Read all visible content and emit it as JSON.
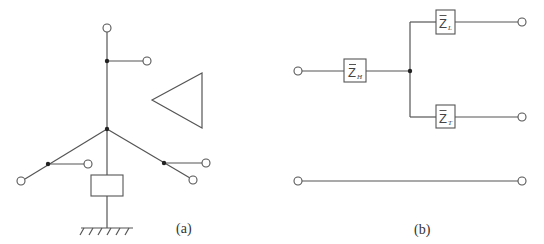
{
  "panel_a": {
    "label": "(a)",
    "description": "Branched mechanical/electrical tree with a box element and ground",
    "triangle_symbol": "triangle-pointing-left"
  },
  "panel_b": {
    "label": "(b)",
    "impedances": {
      "z_h": {
        "main": "Z",
        "sub": "H"
      },
      "z_l": {
        "main": "Z",
        "sub": "L"
      },
      "z_t": {
        "main": "Z",
        "sub": "T"
      }
    }
  }
}
